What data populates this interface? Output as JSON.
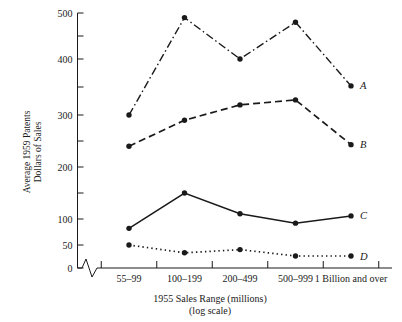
{
  "chart_data": {
    "type": "line",
    "title": "",
    "xlabel": "1955  Sales Range (millions)",
    "xlabel_sub": "(log scale)",
    "ylabel_line1": "Average 1959 Patents",
    "ylabel_line2": "Dollars of Sales",
    "categories": [
      "55–99",
      "100–199",
      "200–499",
      "500–999",
      "1 Billion and over"
    ],
    "ylim": [
      0,
      500
    ],
    "ytick_labels": [
      "0",
      "50",
      "100",
      "200",
      "300",
      "400",
      "500"
    ],
    "ytick_values": [
      0,
      50,
      100,
      200,
      300,
      400,
      500
    ],
    "yminor_values": [
      150,
      250,
      350,
      450
    ],
    "y_axis_note": "non-uniform axis: 0–50–100 compressed, minor ticks at 150, 250, 350, 450",
    "grid": false,
    "legend": "right-end series tags",
    "axis_break": "zigzag break on x-axis between origin and first category",
    "series": [
      {
        "name": "A",
        "label": "A",
        "style": "dash-dot",
        "color": "#1a1a1a",
        "values": [
          300,
          490,
          400,
          480,
          352
        ]
      },
      {
        "name": "B",
        "label": "B",
        "style": "dashed",
        "color": "#1a1a1a",
        "values": [
          240,
          290,
          318,
          327,
          243
        ]
      },
      {
        "name": "C",
        "label": "C",
        "style": "solid",
        "color": "#1a1a1a",
        "values": [
          82,
          150,
          110,
          92,
          106
        ]
      },
      {
        "name": "D",
        "label": "D",
        "style": "dotted",
        "color": "#1a1a1a",
        "values": [
          50,
          33,
          40,
          26,
          26
        ]
      }
    ]
  }
}
